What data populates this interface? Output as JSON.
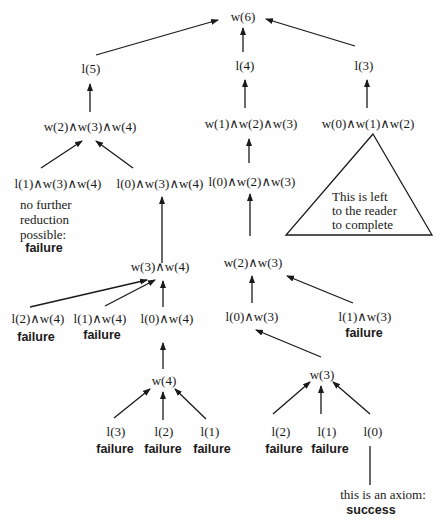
{
  "nodes": {
    "root": "w(6)",
    "l5": "l(5)",
    "l4": "l(4)",
    "l3": "l(3)",
    "w234": "w(2)∧w(3)∧w(4)",
    "w123": "w(1)∧w(2)∧w(3)",
    "w012": "w(0)∧w(1)∧w(2)",
    "l1w34": "l(1)∧w(3)∧w(4)",
    "l0w34": "l(0)∧w(3)∧w(4)",
    "l0w23": "l(0)∧w(2)∧w(3)",
    "w34": "w(3)∧w(4)",
    "w23": "w(2)∧w(3)",
    "l2w4": "l(2)∧w(4)",
    "l1w4": "l(1)∧w(4)",
    "l0w4": "l(0)∧w(4)",
    "l0w3": "l(0)∧w(3)",
    "l1w3": "l(1)∧w(3)",
    "w4": "w(4)",
    "w3": "w(3)",
    "a_l3": "l(3)",
    "a_l2": "l(2)",
    "a_l1": "l(1)",
    "b_l2": "l(2)",
    "b_l1": "l(1)",
    "b_l0": "l(0)"
  },
  "annotations": {
    "no_reduction": [
      "no further",
      "reduction",
      "possible:"
    ],
    "failure": "failure",
    "triangle": [
      "This is left",
      "to the reader",
      "to complete"
    ],
    "axiom": "this is an axiom:",
    "success": "success"
  }
}
